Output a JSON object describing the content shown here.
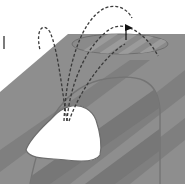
{
  "diagram": {
    "title": "Golf bunker shot trajectories",
    "colors": {
      "background": "#ffffff",
      "fairway": "#8c8c8c",
      "fairway_stripe": "#7d7d7d",
      "rough_edge": "#9a9a9a",
      "green_outline": "#6f6f6f",
      "bunker": "#ffffff",
      "trajectory": "#3a3a3a",
      "flag": "#111111",
      "marker": "#333333"
    },
    "elements": {
      "bunker": {
        "label": "bunker"
      },
      "green": {
        "label": "green"
      },
      "flag": {
        "label": "flag"
      },
      "trajectories": [
        {
          "label": "short-left-arc"
        },
        {
          "label": "long-right-arc"
        },
        {
          "label": "high-arc-to-flag"
        },
        {
          "label": "mid-arc-to-green"
        }
      ],
      "marker": {
        "label": "vertical marker line"
      }
    }
  }
}
